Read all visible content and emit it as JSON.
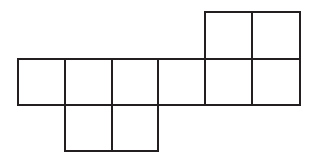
{
  "figure": {
    "name": "polyomino-net",
    "background_color": "#ffffff",
    "line_color": "#231f20",
    "line_width": 2,
    "cell_size": 47,
    "origin_x": 18,
    "origin_y": 12,
    "columns": 6,
    "rows": 3,
    "square_count": 10,
    "rows_data": [
      {
        "name": "top-row",
        "row_index": 0,
        "y": 12,
        "cell_count": 2,
        "column_start": 4,
        "columns": [
          4,
          5
        ],
        "x_start": 205,
        "x_end": 300
      },
      {
        "name": "middle-row",
        "row_index": 1,
        "y": 59,
        "cell_count": 6,
        "column_start": 0,
        "columns": [
          0,
          1,
          2,
          3,
          4,
          5
        ],
        "x_start": 18,
        "x_end": 300
      },
      {
        "name": "bottom-row",
        "row_index": 2,
        "y": 105,
        "cell_count": 2,
        "column_start": 1,
        "columns": [
          1,
          2
        ],
        "x_start": 65,
        "x_end": 158
      }
    ],
    "cells": [
      {
        "id": "r0c4",
        "row": 0,
        "col": 4,
        "x": 205,
        "y": 12,
        "w": 47,
        "h": 47
      },
      {
        "id": "r0c5",
        "row": 0,
        "col": 5,
        "x": 252,
        "y": 12,
        "w": 48,
        "h": 47
      },
      {
        "id": "r1c0",
        "row": 1,
        "col": 0,
        "x": 18,
        "y": 59,
        "w": 47,
        "h": 46
      },
      {
        "id": "r1c1",
        "row": 1,
        "col": 1,
        "x": 65,
        "y": 59,
        "w": 47,
        "h": 46
      },
      {
        "id": "r1c2",
        "row": 1,
        "col": 2,
        "x": 112,
        "y": 59,
        "w": 46,
        "h": 46
      },
      {
        "id": "r1c3",
        "row": 1,
        "col": 3,
        "x": 158,
        "y": 59,
        "w": 47,
        "h": 46
      },
      {
        "id": "r1c4",
        "row": 1,
        "col": 4,
        "x": 205,
        "y": 59,
        "w": 47,
        "h": 46
      },
      {
        "id": "r1c5",
        "row": 1,
        "col": 5,
        "x": 252,
        "y": 59,
        "w": 48,
        "h": 46
      },
      {
        "id": "r2c1",
        "row": 2,
        "col": 1,
        "x": 65,
        "y": 105,
        "w": 47,
        "h": 46
      },
      {
        "id": "r2c2",
        "row": 2,
        "col": 2,
        "x": 112,
        "y": 105,
        "w": 46,
        "h": 46
      }
    ]
  }
}
